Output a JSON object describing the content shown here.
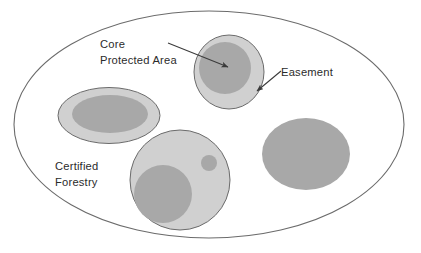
{
  "figure": {
    "type": "conceptual-nested-area-diagram",
    "background_color": "#ffffff"
  },
  "colors": {
    "outline": "#6b6b6b",
    "light_fill": "#d0d0d0",
    "dark_fill": "#a8a8a8",
    "text": "#2b2b2b",
    "arrow": "#3a3a3a",
    "background": "#ffffff"
  },
  "labels": {
    "core_protected_area_line1": "Core",
    "core_protected_area_line2": "Protected Area",
    "easement": "Easement",
    "certified_forestry_line1": "Certified",
    "certified_forestry_line2": "Forestry"
  },
  "shapes": {
    "outer_boundary": {
      "name": "Certified Forestry",
      "cx": 209,
      "cy": 124.5,
      "rx": 195,
      "ry": 113.5,
      "fill": "none",
      "stroke": "#6b6b6b"
    },
    "left_ellipse": {
      "easement_cx": 109,
      "easement_cy": 115.5,
      "easement_rx": 51,
      "easement_ry": 28,
      "core_cx": 110,
      "core_cy": 114,
      "core_rx": 38,
      "core_ry": 19
    },
    "top_circle": {
      "easement_cx": 229,
      "easement_cy": 72,
      "easement_rx": 35,
      "easement_ry": 37,
      "core_cx": 225,
      "core_cy": 68,
      "core_rx": 26,
      "core_ry": 26
    },
    "bottom_circle": {
      "easement_cx": 180,
      "easement_cy": 180,
      "easement_rx": 50,
      "easement_ry": 50,
      "core_cx": 163,
      "core_cy": 194,
      "core_rx": 29,
      "core_ry": 29,
      "core_small_cx": 209,
      "core_small_cy": 163,
      "core_small_rx": 8,
      "core_small_ry": 8
    },
    "right_ellipse": {
      "core_cx": 306,
      "core_cy": 154,
      "core_rx": 44,
      "core_ry": 36
    }
  },
  "annotations": [
    {
      "name": "core-protected-area-arrow",
      "label": "Core Protected Area",
      "from_x": 168,
      "from_y": 43,
      "to_x": 228,
      "to_y": 67
    },
    {
      "name": "easement-arrow",
      "label": "Easement",
      "from_x": 281,
      "from_y": 71,
      "to_x": 257,
      "to_y": 91
    }
  ],
  "text_positions": {
    "core_line1_x": 100,
    "core_line1_y": 48,
    "core_line2_x": 100,
    "core_line2_y": 64,
    "easement_x": 281,
    "easement_y": 76,
    "certified_line1_x": 55,
    "certified_line1_y": 170,
    "certified_line2_x": 55,
    "certified_line2_y": 186
  }
}
